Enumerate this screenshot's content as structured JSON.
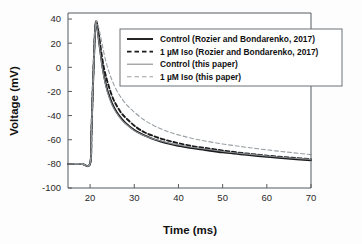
{
  "figure": {
    "background_color": "#fdfdfd",
    "plot_border_color": "#555a5e"
  },
  "axes": {
    "x": {
      "title": "Time (ms)",
      "ticks": [
        "20",
        "30",
        "40",
        "50",
        "60",
        "70"
      ],
      "range": [
        15,
        70
      ],
      "tick_values": [
        20,
        30,
        40,
        50,
        60,
        70
      ]
    },
    "y": {
      "title": "Voltage (mV)",
      "ticks": [
        "40",
        "20",
        "0",
        "-20",
        "-40",
        "-60",
        "-80",
        "-100"
      ],
      "range": [
        -100,
        45
      ],
      "tick_values": [
        40,
        20,
        0,
        -20,
        -40,
        -60,
        -80,
        -100
      ]
    }
  },
  "legend": {
    "position": "top-right",
    "entries": [
      {
        "label": "Control (Rozier and Bondarenko, 2017)",
        "style": "solid",
        "color": "#1a1a1a",
        "width": 1.9
      },
      {
        "label": "1 µM Iso (Rozier and Bondarenko, 2017)",
        "style": "dashed",
        "color": "#1a1a1a",
        "width": 1.9
      },
      {
        "label": "Control (this paper)",
        "style": "solid",
        "color": "#888d91",
        "width": 1.1
      },
      {
        "label": "1 µM Iso (this paper)",
        "style": "dashed",
        "color": "#9aa0a4",
        "width": 1.1
      }
    ]
  },
  "chart_data": {
    "type": "line",
    "title": "",
    "xlabel": "Time (ms)",
    "ylabel": "Voltage (mV)",
    "xlim": [
      15,
      70
    ],
    "ylim": [
      -100,
      45
    ],
    "grid": false,
    "legend_position": "top-right",
    "x_ticks": [
      20,
      30,
      40,
      50,
      60,
      70
    ],
    "y_ticks": [
      40,
      20,
      0,
      -20,
      -40,
      -60,
      -80,
      -100
    ],
    "series": [
      {
        "name": "Control (Rozier and Bondarenko, 2017)",
        "style": "solid",
        "color": "#1a1a1a",
        "width": 1.9,
        "x": [
          15,
          18,
          20,
          20.3,
          20.6,
          20.9,
          21.1,
          21.3,
          21.6,
          22,
          22.5,
          23,
          23.5,
          24,
          25,
          26,
          27,
          28,
          30,
          32,
          34,
          36,
          38,
          40,
          43,
          46,
          50,
          54,
          58,
          62,
          66,
          70
        ],
        "y": [
          -80,
          -80,
          -80,
          -55,
          -20,
          10,
          28,
          37,
          33,
          22,
          8,
          -4,
          -13,
          -20,
          -30,
          -37,
          -42,
          -46,
          -52,
          -56,
          -59,
          -61.5,
          -63.5,
          -65,
          -67,
          -68.5,
          -70.5,
          -72,
          -73.5,
          -74.8,
          -76,
          -77
        ]
      },
      {
        "name": "1 µM Iso (Rozier and Bondarenko, 2017)",
        "style": "dashed",
        "color": "#1a1a1a",
        "width": 1.9,
        "x": [
          15,
          18,
          20,
          20.3,
          20.6,
          20.9,
          21.1,
          21.35,
          21.7,
          22.1,
          22.6,
          23.1,
          23.7,
          24.3,
          25.2,
          26.2,
          27.2,
          28.4,
          30.4,
          32.4,
          34.4,
          36.4,
          38.4,
          40.4,
          43.4,
          46.4,
          50.4,
          54.4,
          58.4,
          62.4,
          66.4,
          70
        ],
        "y": [
          -80,
          -80,
          -80,
          -54,
          -19,
          11,
          29,
          38,
          34,
          24,
          11,
          0,
          -9,
          -16.5,
          -26,
          -33,
          -38.5,
          -43,
          -49.5,
          -54,
          -57,
          -59.5,
          -61.5,
          -63.2,
          -65.5,
          -67,
          -69.2,
          -71,
          -72.6,
          -74,
          -75.2,
          -76.2
        ]
      },
      {
        "name": "Control (this paper)",
        "style": "solid",
        "color": "#888d91",
        "width": 1.1,
        "x": [
          15,
          18,
          20,
          20.3,
          20.6,
          20.9,
          21.1,
          21.3,
          21.6,
          22,
          22.5,
          23,
          23.5,
          24,
          25,
          26,
          27,
          28,
          30,
          32,
          34,
          36,
          38,
          40,
          43,
          46,
          50,
          54,
          58,
          62,
          66,
          70
        ],
        "y": [
          -80,
          -80,
          -80,
          -56,
          -21,
          9,
          27,
          36.5,
          32,
          21,
          6.5,
          -5.5,
          -14.5,
          -21.5,
          -31.5,
          -38,
          -43,
          -46.8,
          -52.5,
          -56.3,
          -59,
          -61,
          -62.8,
          -64.3,
          -66.2,
          -67.7,
          -69.7,
          -71.3,
          -72.8,
          -74.1,
          -75.3,
          -76.3
        ]
      },
      {
        "name": "1 µM Iso (this paper)",
        "style": "dashed",
        "color": "#9aa0a4",
        "width": 1.1,
        "x": [
          15,
          18,
          20,
          20.3,
          20.6,
          20.9,
          21.1,
          21.4,
          21.8,
          22.3,
          22.9,
          23.5,
          24.2,
          25,
          26,
          27.2,
          28.4,
          29.8,
          32,
          34,
          36,
          38,
          40,
          43,
          46,
          50,
          54,
          58,
          62,
          66,
          70
        ],
        "y": [
          -80,
          -80,
          -80,
          -53,
          -18,
          12,
          30,
          38.5,
          35,
          27,
          16,
          6,
          -3,
          -11,
          -19,
          -26,
          -31.5,
          -36.5,
          -43,
          -47.5,
          -51,
          -53.8,
          -56,
          -58.8,
          -61,
          -63.5,
          -65.6,
          -67.5,
          -69.2,
          -70.8,
          -72.3
        ]
      }
    ]
  }
}
